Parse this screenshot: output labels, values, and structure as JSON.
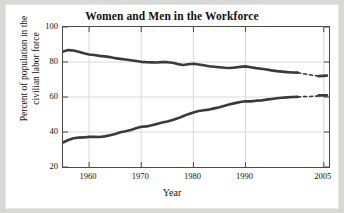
{
  "chart_data": {
    "type": "line",
    "title": "Women and Men in the Workforce",
    "xlabel": "Year",
    "ylabel_line1": "Percent of population in the",
    "ylabel_line2": "civilian labor force",
    "xlim": [
      1955,
      2006
    ],
    "ylim": [
      20,
      100
    ],
    "xticks": [
      1960,
      1970,
      1980,
      1990,
      2005
    ],
    "xtick_labels": [
      "1960",
      "1970",
      "1980",
      "1990",
      "2005"
    ],
    "yticks": [
      20,
      40,
      60,
      80,
      100
    ],
    "ytick_labels": [
      "20",
      "40",
      "60",
      "80",
      "100"
    ],
    "grid": true,
    "legend": "none",
    "line_color": "#3a3a3a",
    "projection_style": "dashed",
    "series": [
      {
        "name": "Men",
        "style": "solid",
        "x": [
          1955,
          1956,
          1957,
          1958,
          1959,
          1960,
          1961,
          1962,
          1963,
          1964,
          1965,
          1966,
          1967,
          1968,
          1969,
          1970,
          1971,
          1972,
          1973,
          1974,
          1975,
          1976,
          1977,
          1978,
          1979,
          1980,
          1981,
          1982,
          1983,
          1984,
          1985,
          1986,
          1987,
          1988,
          1989,
          1990,
          1991,
          1992,
          1993,
          1994,
          1995,
          1996,
          1997,
          1998,
          1999,
          2000
        ],
        "y": [
          86.0,
          86.8,
          86.6,
          85.8,
          85.0,
          84.3,
          84.0,
          83.5,
          83.2,
          82.8,
          82.2,
          81.8,
          81.4,
          81.0,
          80.6,
          80.1,
          79.9,
          79.8,
          79.7,
          79.9,
          79.9,
          79.6,
          78.8,
          78.3,
          78.7,
          79.0,
          78.6,
          78.1,
          77.6,
          77.3,
          77.0,
          76.7,
          76.6,
          76.9,
          77.2,
          77.5,
          77.0,
          76.5,
          76.1,
          75.7,
          75.2,
          74.8,
          74.5,
          74.2,
          74.0,
          73.9
        ]
      },
      {
        "name": "Men (projected)",
        "style": "dashed",
        "x": [
          2000,
          2001,
          2002,
          2003,
          2004
        ],
        "y": [
          73.9,
          73.3,
          72.8,
          72.4,
          72.0
        ]
      },
      {
        "name": "Men (2004-2005)",
        "style": "solid",
        "x": [
          2004,
          2005.6
        ],
        "y": [
          71.9,
          72.2
        ]
      },
      {
        "name": "Women",
        "style": "solid",
        "x": [
          1955,
          1956,
          1957,
          1958,
          1959,
          1960,
          1961,
          1962,
          1963,
          1964,
          1965,
          1966,
          1967,
          1968,
          1969,
          1970,
          1971,
          1972,
          1973,
          1974,
          1975,
          1976,
          1977,
          1978,
          1979,
          1980,
          1981,
          1982,
          1983,
          1984,
          1985,
          1986,
          1987,
          1988,
          1989,
          1990,
          1991,
          1992,
          1993,
          1994,
          1995,
          1996,
          1997,
          1998,
          1999,
          2000
        ],
        "y": [
          34.0,
          35.4,
          36.4,
          36.8,
          36.9,
          37.2,
          37.3,
          37.1,
          37.5,
          38.2,
          38.9,
          39.8,
          40.4,
          41.2,
          42.2,
          43.0,
          43.2,
          43.8,
          44.6,
          45.4,
          46.0,
          46.8,
          47.8,
          49.0,
          50.2,
          51.2,
          52.0,
          52.4,
          52.8,
          53.5,
          54.2,
          55.0,
          55.8,
          56.5,
          57.1,
          57.6,
          57.5,
          57.9,
          58.0,
          58.5,
          58.9,
          59.3,
          59.6,
          59.8,
          60.0,
          60.1
        ]
      },
      {
        "name": "Women (projected)",
        "style": "dashed",
        "x": [
          2000,
          2001,
          2002,
          2003,
          2004
        ],
        "y": [
          60.1,
          60.2,
          60.3,
          60.4,
          60.6
        ]
      },
      {
        "name": "Women (2004-2005)",
        "style": "solid",
        "x": [
          2004,
          2005.6
        ],
        "y": [
          60.9,
          60.9
        ]
      }
    ]
  }
}
